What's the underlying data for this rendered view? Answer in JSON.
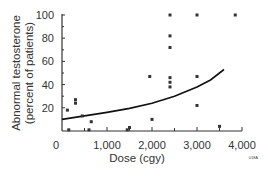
{
  "chart_data": {
    "type": "scatter",
    "title": "",
    "xlabel": "Dose (cgy)",
    "ylabel_line1": "Abnormal testosterone",
    "ylabel_line2": "(percent of patients)",
    "xlim": [
      0,
      4000
    ],
    "ylim": [
      0,
      100
    ],
    "x_ticks": [
      0,
      1000,
      2000,
      3000,
      4000
    ],
    "x_tick_labels": [
      "0",
      "1,000",
      "2,000",
      "3,000",
      "4,000"
    ],
    "y_ticks": [
      20,
      40,
      60,
      80,
      100
    ],
    "y_tick_labels": [
      "20",
      "40",
      "60",
      "80",
      "100"
    ],
    "y_zero_label": "0",
    "grid": false,
    "legend": null,
    "corner_mark": "018A",
    "series": [
      {
        "name": "Study data points",
        "points": [
          {
            "x": 120,
            "y": 18
          },
          {
            "x": 150,
            "y": 1
          },
          {
            "x": 300,
            "y": 27
          },
          {
            "x": 300,
            "y": 24
          },
          {
            "x": 450,
            "y": 13
          },
          {
            "x": 650,
            "y": 8
          },
          {
            "x": 600,
            "y": 1
          },
          {
            "x": 1450,
            "y": 1
          },
          {
            "x": 1500,
            "y": 3
          },
          {
            "x": 2000,
            "y": 10
          },
          {
            "x": 1950,
            "y": 47
          },
          {
            "x": 2400,
            "y": 100
          },
          {
            "x": 2400,
            "y": 82
          },
          {
            "x": 2400,
            "y": 72
          },
          {
            "x": 2400,
            "y": 46
          },
          {
            "x": 2400,
            "y": 42
          },
          {
            "x": 2400,
            "y": 38
          },
          {
            "x": 3000,
            "y": 100
          },
          {
            "x": 3000,
            "y": 47
          },
          {
            "x": 3000,
            "y": 22
          },
          {
            "x": 3500,
            "y": 4
          },
          {
            "x": 3850,
            "y": 100
          }
        ]
      },
      {
        "name": "Fitted curve",
        "type": "line",
        "x": [
          0,
          500,
          1000,
          1500,
          2000,
          2500,
          3000,
          3300,
          3600
        ],
        "y": [
          10,
          13,
          16,
          19.5,
          24,
          30,
          38,
          44,
          53
        ]
      }
    ]
  }
}
